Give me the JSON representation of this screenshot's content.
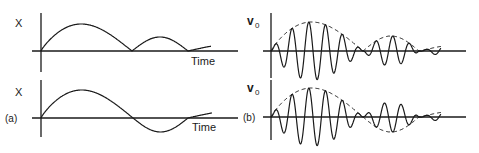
{
  "figure": {
    "panel_a_label": "(a)",
    "panel_b_label": "(b)",
    "colors": {
      "ink": "#1a1a1a",
      "background": "#ffffff"
    }
  },
  "panels": [
    {
      "id": "a-top",
      "ylabel": "X",
      "xlabel": "Time",
      "description": "Rectified (absolute) modulating signal: sine-like humps all above zero",
      "origin": [
        41,
        51
      ],
      "axis": {
        "y_top": 13,
        "y_bottom": 72,
        "x_left": 32,
        "x_right": 238
      },
      "curve_type": "abs",
      "signal": {
        "x_start": 41,
        "x_end": 211,
        "zero1": 132,
        "zero2": 188,
        "amp1": 27,
        "amp2": 14,
        "amp3": 8
      }
    },
    {
      "id": "a-bottom",
      "ylabel": "X",
      "xlabel": "Time",
      "description": "Modulating signal with sign: positive hump then negative lobe",
      "origin": [
        41,
        118
      ],
      "axis": {
        "y_top": 80,
        "y_bottom": 137,
        "x_left": 32,
        "x_right": 238
      },
      "curve_type": "signed",
      "signal": {
        "x_start": 41,
        "x_end": 212,
        "zero1": 133,
        "zero2": 188,
        "amp1": 28,
        "amp2": 14,
        "amp3": 8
      }
    },
    {
      "id": "b-top",
      "ylabel": "v₀",
      "description": "Amplitude-modulated carrier with rectified (dashed) envelope",
      "origin": [
        271,
        51
      ],
      "axis": {
        "y_top": 13,
        "y_bottom": 78,
        "x_left": 263,
        "x_right": 466
      },
      "curve_type": "abs",
      "signal": {
        "x_start": 271,
        "x_end": 441,
        "zero1": 363,
        "zero2": 419,
        "amp1": 29,
        "amp2": 15,
        "amp3": 8,
        "carrier_period": 16.8
      }
    },
    {
      "id": "b-bottom",
      "ylabel": "v₀",
      "description": "Amplitude-modulated carrier with signed (dashed) envelope, phase reversal at zero crossing",
      "origin": [
        271,
        117
      ],
      "axis": {
        "y_top": 80,
        "y_bottom": 140,
        "x_left": 263,
        "x_right": 466
      },
      "curve_type": "signed",
      "signal": {
        "x_start": 271,
        "x_end": 441,
        "zero1": 363,
        "zero2": 419,
        "amp1": 29,
        "amp2": 15,
        "amp3": 8,
        "carrier_period": 16.8
      }
    }
  ],
  "labels": [
    {
      "text": "X",
      "x": 15,
      "y": 27,
      "size": 11
    },
    {
      "text": "Time",
      "x": 191,
      "y": 65,
      "size": 11
    },
    {
      "text": "X",
      "x": 15,
      "y": 96,
      "size": 11
    },
    {
      "text": "(a)",
      "x": 5,
      "y": 122,
      "size": 10
    },
    {
      "text": "Time",
      "x": 192,
      "y": 131,
      "size": 11
    },
    {
      "text": "v",
      "x": 247,
      "y": 25,
      "size": 12
    },
    {
      "text": "0",
      "x": 255,
      "y": 28,
      "size": 8
    },
    {
      "text": "v",
      "x": 247,
      "y": 92,
      "size": 12
    },
    {
      "text": "0",
      "x": 255,
      "y": 95,
      "size": 8
    },
    {
      "text": "(b)",
      "x": 243,
      "y": 121,
      "size": 10
    }
  ]
}
